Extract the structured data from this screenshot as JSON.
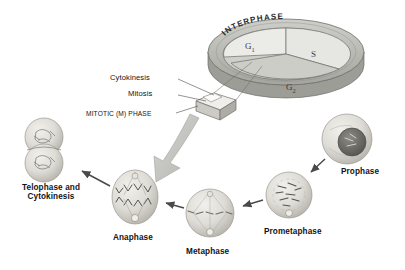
{
  "diagram": {
    "background_color": "#ffffff",
    "ink_color": "#141414"
  },
  "interphase_disc": {
    "ring_label": "INTERPHASE",
    "ring_color": "#b9b9b5",
    "sectors": [
      {
        "id": "g1",
        "label": "G",
        "subscript": "1",
        "fill": "#ebebe8"
      },
      {
        "id": "s",
        "label": "S",
        "subscript": "",
        "fill": "#e6e6e2"
      },
      {
        "id": "g2",
        "label": "G",
        "subscript": "2",
        "fill": "#c9c9c4"
      }
    ]
  },
  "leaders": [
    {
      "id": "cytokinesis",
      "label": "Cytokinesis"
    },
    {
      "id": "mitosis",
      "label": "Mitosis"
    },
    {
      "id": "mitotic-phase",
      "label": "MITOTIC (M) PHASE"
    }
  ],
  "mitosis_stages": [
    {
      "id": "telophase",
      "label": "Telophase and\nCytokinesis",
      "line1": "Telophase and",
      "line2": "Cytokinesis"
    },
    {
      "id": "anaphase",
      "label": "Anaphase"
    },
    {
      "id": "metaphase",
      "label": "Metaphase"
    },
    {
      "id": "prometaphase",
      "label": "Prometaphase"
    },
    {
      "id": "prophase",
      "label": "Prophase"
    }
  ],
  "colors": {
    "cell_fill": "#dedcd6",
    "cell_shade": "#bdbab3",
    "arrow": "#4a4a4a",
    "big_arrow": "#c6c6c2",
    "outline": "#6f6f6a"
  }
}
